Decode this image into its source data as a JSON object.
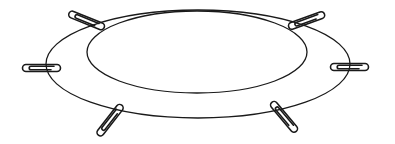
{
  "figure": {
    "stroke_color": "#1a1a1a",
    "background": "#ffffff",
    "outer_ellipse": {
      "cx": 198,
      "cy": 64,
      "rx": 152,
      "ry": 54
    },
    "inner_ellipse": {
      "cx": 197,
      "cy": 52,
      "rx": 110,
      "ry": 41
    },
    "paperclips": [
      {
        "name": "top-left",
        "x": 88,
        "y": 21,
        "angle": 22
      },
      {
        "name": "left",
        "x": 43,
        "y": 68,
        "angle": 0
      },
      {
        "name": "bottom-left",
        "x": 111,
        "y": 119,
        "angle": -52
      },
      {
        "name": "top-right",
        "x": 308,
        "y": 20,
        "angle": -20
      },
      {
        "name": "right",
        "x": 351,
        "y": 67,
        "angle": 0
      },
      {
        "name": "bottom-right",
        "x": 285,
        "y": 118,
        "angle": 50
      }
    ]
  }
}
